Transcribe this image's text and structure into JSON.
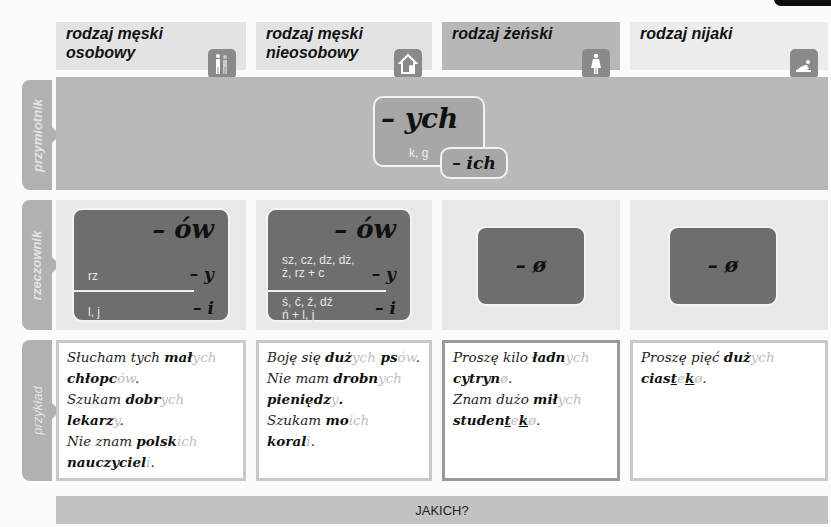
{
  "columns": [
    {
      "title_line1": "rodzaj męski",
      "title_line2": "osobowy",
      "icon": "men-group-icon",
      "bg": "#e3e3e3"
    },
    {
      "title_line1": "rodzaj męski",
      "title_line2": "nieosobowy",
      "icon": "house-animal-icon",
      "bg": "#e3e3e3"
    },
    {
      "title_line1": "rodzaj żeński",
      "title_line2": "",
      "icon": "woman-icon",
      "bg": "#b7b7b7"
    },
    {
      "title_line1": "rodzaj nijaki",
      "title_line2": "",
      "icon": "child-crawling-icon",
      "bg": "#ececec"
    }
  ],
  "rows": {
    "adjective": "przymiotnik",
    "noun": "rzeczownik",
    "example": "przykład"
  },
  "adjective": {
    "main_ending": "– ych",
    "condition": "k, g",
    "alt_ending": "– ich"
  },
  "noun": {
    "col1": {
      "main": "– ów",
      "row1_cons": "rz",
      "row1_end": "– y",
      "row2_cons": "l, j",
      "row2_end": "– i"
    },
    "col2": {
      "main": "– ów",
      "row1_cons_a": "sz, cz, dz, dż,",
      "row1_cons_b": "ż, rz + c",
      "row1_end": "– y",
      "row2_cons_a": "ś, ć, ź, dź",
      "row2_cons_b": "ń + l, j",
      "row2_end": "– i"
    },
    "col3": {
      "main": "– ø"
    },
    "col4": {
      "main": "– ø"
    }
  },
  "examples": {
    "col1": [
      {
        "plain": "Słucham tych ",
        "stem": "mał",
        "ending": "ych"
      },
      {
        "stem": "chłopc",
        "ending": "ów",
        "punct": "."
      },
      {
        "plain": "Szukam ",
        "stem": "dobr",
        "ending": "ych"
      },
      {
        "stem": "lekarz",
        "ending": "y",
        "punct": "."
      },
      {
        "plain": "Nie znam ",
        "stem": "polsk",
        "ending": "ich"
      },
      {
        "stem": "nauczyciel",
        "ending": "i",
        "punct": "."
      }
    ],
    "col2": [
      {
        "plain": "Boję się ",
        "stem": "duż",
        "ending": "ych",
        "stem2": " ps",
        "ending2": "ów",
        "punct": "."
      },
      {
        "plain": "Nie mam ",
        "stem": "drobn",
        "ending": "ych"
      },
      {
        "stem": "pieniędz",
        "ending": "y",
        "punct": "."
      },
      {
        "plain": "Szukam ",
        "stem": "mo",
        "ending": "ich",
        "stem2": " koral",
        "ending2": "i",
        "punct": "."
      }
    ],
    "col3": [
      {
        "plain": "Proszę kilo ",
        "stem": "ładn",
        "ending": "ych"
      },
      {
        "stem": "cytryn",
        "ending": "ø",
        "punct": "."
      },
      {
        "plain": "Znam dużo ",
        "stem": "mił",
        "ending": "ych"
      },
      {
        "stem_a": "studen",
        "u1": "t",
        "mid": "e",
        "u2": "k",
        "ending": "ø",
        "punct": "."
      }
    ],
    "col4": [
      {
        "plain": "Proszę pięć ",
        "stem": "duż",
        "ending": "ych"
      },
      {
        "stem_a": "cias",
        "u1": "t",
        "mid": "e",
        "u2": "k",
        "ending": "ø",
        "punct": "."
      }
    ]
  },
  "footer": {
    "question": "JAKICH?"
  }
}
